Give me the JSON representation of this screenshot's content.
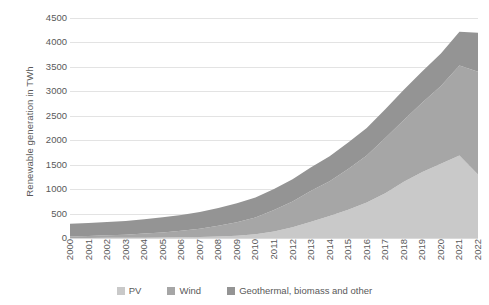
{
  "chart_data": {
    "type": "area",
    "stacked": true,
    "title": "",
    "xlabel": "",
    "ylabel": "Renewable generation in TWh",
    "ylim": [
      0,
      4500
    ],
    "ytick_step": 500,
    "yticks": [
      4500,
      4000,
      3500,
      3000,
      2500,
      2000,
      1500,
      1000,
      500,
      0
    ],
    "ytick_labels": [
      "4500",
      "4000",
      "3500",
      "3000",
      "2500",
      "2000",
      "1500",
      "1000",
      "500",
      "0"
    ],
    "grid": true,
    "legend_position": "bottom",
    "categories": [
      "2000",
      "2001",
      "2002",
      "2003",
      "2004",
      "2005",
      "2006",
      "2007",
      "2008",
      "2009",
      "2010",
      "2011",
      "2012",
      "2013",
      "2014",
      "2015",
      "2016",
      "2017",
      "2018",
      "2019",
      "2020",
      "2021",
      "2022"
    ],
    "series": [
      {
        "name": "PV",
        "color": "#c9c9c9",
        "values": [
          1,
          2,
          3,
          4,
          6,
          9,
          13,
          19,
          30,
          47,
          77,
          135,
          222,
          333,
          451,
          580,
          727,
          917,
          1150,
          1350,
          1520,
          1690,
          1300
        ]
      },
      {
        "name": "Wind",
        "color": "#a6a6a6",
        "values": [
          31,
          38,
          52,
          63,
          85,
          104,
          133,
          170,
          220,
          276,
          342,
          436,
          526,
          636,
          712,
          831,
          958,
          1128,
          1265,
          1420,
          1590,
          1840,
          2100
        ]
      },
      {
        "name": "Geothermal, biomass and other",
        "color": "#949494",
        "values": [
          258,
          265,
          272,
          282,
          295,
          310,
          325,
          345,
          366,
          389,
          410,
          430,
          455,
          480,
          510,
          540,
          565,
          590,
          615,
          640,
          665,
          690,
          800
        ]
      }
    ],
    "totals": [
      290,
      305,
      327,
      349,
      386,
      423,
      471,
      534,
      616,
      712,
      829,
      1001,
      1203,
      1449,
      1673,
      1951,
      2250,
      2635,
      3030,
      3410,
      3775,
      4220,
      4200
    ],
    "stack_order_bottom_to_top": [
      "PV",
      "Wind",
      "Geothermal, biomass and other"
    ]
  },
  "legend": {
    "items": [
      {
        "label": "PV",
        "color": "#c9c9c9"
      },
      {
        "label": "Wind",
        "color": "#a6a6a6"
      },
      {
        "label": "Geothermal, biomass and other",
        "color": "#949494"
      }
    ]
  },
  "colors": {
    "gridline": "#e3e3e3",
    "text": "#595959",
    "background": "#ffffff"
  }
}
